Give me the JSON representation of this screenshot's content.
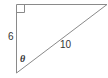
{
  "diagram": {
    "type": "right-triangle",
    "labels": {
      "vertical_leg": "6",
      "hypotenuse": "10",
      "angle": "θ"
    },
    "right_angle_marker": "top-left",
    "colors": {
      "stroke": "#8a8a8a",
      "text": "#333333",
      "background": "#ffffff"
    }
  }
}
